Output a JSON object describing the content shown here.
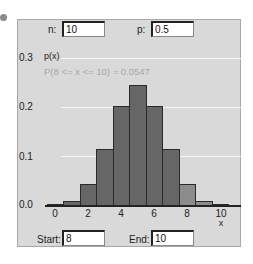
{
  "params": {
    "n_label": "n:",
    "n_value": "10",
    "p_label": "p:",
    "p_value": "0.5"
  },
  "range": {
    "start_label": "Start:",
    "start_value": "8",
    "end_label": "End:",
    "end_value": "10"
  },
  "probability_text": "P(8 <= x <= 10) = 0.0547",
  "colors": {
    "bar": "#666666",
    "bar_selected": "#8c8c8c",
    "background": "#d9d9d9",
    "grid": "#f4f4f4"
  },
  "chart_data": {
    "type": "bar",
    "title": "",
    "xlabel": "x",
    "ylabel": "p(x)",
    "categories": [
      "0",
      "1",
      "2",
      "3",
      "4",
      "5",
      "6",
      "7",
      "8",
      "9",
      "10"
    ],
    "values": [
      0.001,
      0.0098,
      0.0439,
      0.1172,
      0.2051,
      0.2461,
      0.2051,
      0.1172,
      0.0439,
      0.0098,
      0.001
    ],
    "selected_range": [
      8,
      10
    ],
    "x_ticks": [
      "0",
      "2",
      "4",
      "6",
      "8",
      "10"
    ],
    "y_ticks": [
      "0.0",
      "0.1",
      "0.2",
      "0.3"
    ],
    "ylim": [
      0,
      0.3
    ],
    "xlim": [
      0,
      10
    ],
    "grid": true,
    "annotation": "P(8 <= x <= 10) = 0.0547"
  }
}
